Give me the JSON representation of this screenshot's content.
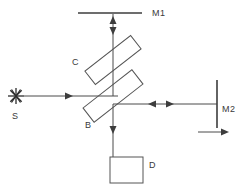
{
  "figure": {
    "background_color": "#ffffff",
    "line_color": "#4a4a4a",
    "label_color": "#3a3a3a",
    "width": 245,
    "height": 191
  },
  "labels": {
    "mirror_1": "M1",
    "mirror_2": "M2",
    "compensator": "C",
    "beamsplitter": "B",
    "source": "S",
    "detector": "D"
  },
  "components": [
    {
      "id": "source",
      "name": "source-star",
      "label": "S",
      "kind": "star",
      "x": 16,
      "y": 96,
      "label_x": 13,
      "label_y": 117
    },
    {
      "id": "mirror-1",
      "name": "mirror-m1",
      "label": "M1",
      "kind": "mirror-horizontal",
      "x1": 78,
      "x2": 142,
      "y": 13,
      "label_x": 152,
      "label_y": 14
    },
    {
      "id": "mirror-2",
      "name": "mirror-m2",
      "label": "M2",
      "kind": "mirror-vertical",
      "x": 217,
      "y1": 80,
      "y2": 128,
      "label_x": 222,
      "label_y": 110
    },
    {
      "id": "compensator",
      "name": "compensator-plate-c",
      "label": "C",
      "kind": "tilted-plate",
      "center_x": 113,
      "center_y": 60,
      "length": 58,
      "thickness": 17,
      "angle_deg": -38,
      "label_x": 74,
      "label_y": 63
    },
    {
      "id": "beamsplitter",
      "name": "beamsplitter-b",
      "label": "B",
      "kind": "tilted-plate",
      "center_x": 113,
      "center_y": 96,
      "length": 62,
      "thickness": 18,
      "angle_deg": -38,
      "label_x": 87,
      "label_y": 125
    },
    {
      "id": "detector",
      "name": "detector-d",
      "label": "D",
      "kind": "box",
      "x": 110,
      "y": 157,
      "width": 33,
      "height": 26,
      "label_x": 149,
      "label_y": 165
    }
  ],
  "beams": [
    {
      "id": "source-to-splitter",
      "name": "beam-source-to-beamsplitter",
      "from": "S",
      "to": "B",
      "x1": 24,
      "y1": 96,
      "x2": 113,
      "y2": 96,
      "arrow_positions": [
        70
      ],
      "arrow_direction": "right"
    },
    {
      "id": "splitter-to-m1",
      "name": "beam-beamsplitter-to-mirror-m1",
      "from": "B",
      "to": "M1",
      "x1": 113,
      "y1": 96,
      "x2": 113,
      "y2": 14,
      "arrow_positions": [
        20,
        32
      ],
      "arrow_direction": "both-vertical"
    },
    {
      "id": "splitter-to-m2",
      "name": "beam-beamsplitter-to-mirror-m2",
      "from": "B",
      "to": "M2",
      "x1": 113,
      "y1": 104,
      "x2": 217,
      "y2": 104,
      "arrow_positions": [
        152,
        172
      ],
      "arrow_direction": "both-horizontal"
    },
    {
      "id": "splitter-to-detector",
      "name": "beam-beamsplitter-to-detector",
      "from": "B",
      "to": "D",
      "x1": 113,
      "y1": 104,
      "x2": 113,
      "y2": 157,
      "arrow_positions": [
        130
      ],
      "arrow_direction": "down"
    },
    {
      "id": "m2-translation-arrow",
      "name": "mirror-m2-translation-arrow",
      "from": "",
      "to": "",
      "x1": 198,
      "y1": 132,
      "x2": 228,
      "y2": 132,
      "arrow_positions": [
        228
      ],
      "arrow_direction": "right"
    }
  ]
}
